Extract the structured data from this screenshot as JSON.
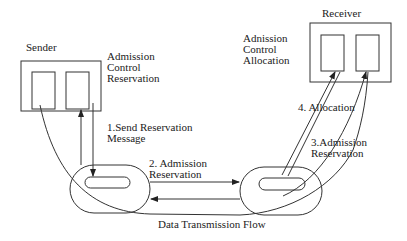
{
  "diagram": {
    "type": "protocol-flow",
    "nodes": {
      "sender": {
        "label": "Sender",
        "side_note": [
          "Admission",
          "Control",
          "Reservation"
        ]
      },
      "receiver": {
        "label": "Receiver",
        "side_note": [
          "Adnission",
          "Control",
          "Allocation"
        ]
      },
      "router_left": {
        "label": ""
      },
      "router_right": {
        "label": ""
      }
    },
    "steps": [
      {
        "id": 1,
        "lines": [
          "1.Send Reservation",
          "Message"
        ]
      },
      {
        "id": 2,
        "lines": [
          "2. Admission",
          "Reservation"
        ]
      },
      {
        "id": 3,
        "lines": [
          "3.Admission",
          "Reservation"
        ]
      },
      {
        "id": 4,
        "lines": [
          "4. Allocation"
        ]
      }
    ],
    "flow_label": "Data Transmission Flow",
    "colors": {
      "stroke": "#333333",
      "text": "#222222",
      "background": "#ffffff"
    }
  }
}
